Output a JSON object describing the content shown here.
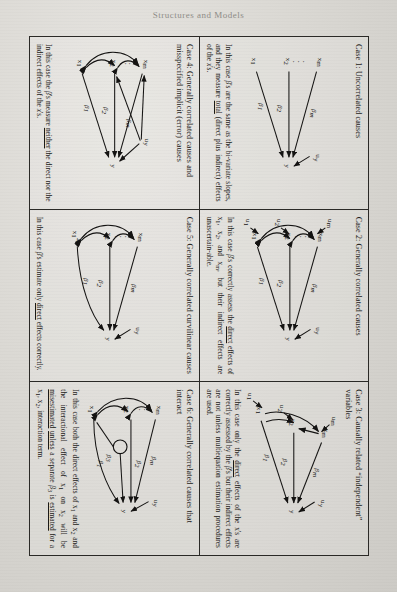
{
  "page": {
    "running_head": "Structures and Models",
    "background_color": "#d8d6d1",
    "ink_color": "#141312"
  },
  "figure": {
    "cases": [
      {
        "id": "case-1",
        "title": "Case 1: Uncorrelated causes",
        "note_html": "In this case <i>β</i>'s are the same as the bi-variate slopes, and they measure <u>total</u> (direct plus indirect) effects of the <i>x</i>'s.",
        "note_text": "In this case β's are the same as the bivariate slopes, and they measure total (direct plus indirect) effects of the x's.",
        "diagram": {
          "type": "path-diagram",
          "nodes": [
            "x₁",
            "x₂",
            "xₘ",
            "y",
            "u_y"
          ],
          "edge_labels": [
            "β₁",
            "β₂",
            "βₘ"
          ],
          "dots": "⋮",
          "features": [
            "no correlation arcs",
            "error term u_y into y"
          ]
        }
      },
      {
        "id": "case-2",
        "title": "Case 2: Generally correlated causes",
        "note_html": "In this case <i>β</i>'s correctly assess the <u>direct</u> effects of x<sub>1</sub>, x<sub>2</sub>, and x<sub>m</sub>, but their indirect effects are unascertain-able.",
        "note_text": "In this case β's correctly assess the direct effects of x₁, x₂, and xₘ, but their indirect effects are unascertainable.",
        "diagram": {
          "type": "path-diagram",
          "nodes": [
            "x₁",
            "x₂",
            "xₘ",
            "y",
            "u₁",
            "u₂",
            "uₘ",
            "u_y"
          ],
          "edge_labels": [
            "β₁",
            "β₂",
            "βₘ"
          ],
          "dots": "⋮",
          "features": [
            "curved double-headed correlation arcs among x's",
            "error terms u on each x"
          ]
        }
      },
      {
        "id": "case-3",
        "title": "Case 3: Causally related “independent” variables",
        "note_html": "In this case only the <u>direct</u> effects of the x's are correctly assessed by the <i>β</i>'s but their indirect effects are not unless multiequation estimation procedures are used.",
        "note_text": "In this case only the direct effects of the x's are correctly assessed by the β's but their indirect effects are not unless multiequation estimation procedures are used.",
        "diagram": {
          "type": "path-diagram",
          "nodes": [
            "x₁",
            "x₂",
            "xₘ",
            "y",
            "u₁",
            "u₂",
            "uₘ",
            "u_y"
          ],
          "edge_labels": [
            "β₁",
            "β₂",
            "βₘ"
          ],
          "features": [
            "single-headed causal arrows between the x's",
            "error terms u on each x"
          ]
        }
      },
      {
        "id": "case-4",
        "title": "Case 4: Generally correlated causes and misspecified implicit (error) causes",
        "note_html": "In this case the <i>β</i>'s measure <u>neither</u> the direct nor the indirect effects of the <i>x</i>'s.",
        "note_text": "In this case the β's measure neither the direct nor the indirect effects of the x's.",
        "diagram": {
          "type": "path-diagram",
          "nodes": [
            "x₁",
            "x₂",
            "xₘ",
            "y",
            "u_y"
          ],
          "edge_labels": [
            "β₁",
            "β₂",
            "βₘ"
          ],
          "dots": "⋮",
          "features": [
            "correlation arcs among x's",
            "u_y has arrows back into x₂ and xₘ (misspecified error causes)"
          ]
        }
      },
      {
        "id": "case-5",
        "title": "Case 5: Generally correlated curvilinear causes",
        "note_html": "In this case <i>β</i>'s estimate only <u>direct</u> effects correctly.",
        "note_text": "In this case β's estimate only direct effects correctly.",
        "diagram": {
          "type": "path-diagram",
          "nodes": [
            "x₁²",
            "x₂",
            "xₘ",
            "y",
            "u_y"
          ],
          "edge_labels": [
            "β₁",
            "β₂",
            "βₘ"
          ],
          "dots": "⋮",
          "features": [
            "squared (curvilinear) term x₁²",
            "correlation arcs among x's"
          ]
        }
      },
      {
        "id": "case-6",
        "title": "Case 6: Generally correlated causes that interact",
        "note_html": "In this case both the direct effects of x<sub>1</sub> and x<sub>2</sub> and the interactional effect of x<sub>1</sub> on x<sub>2</sub> will be <u>misestimated</u> <u>unless</u> a separate <i>β</i><sub>3</sub> is <u>estimated</u> for a x<sub>1</sub>, x<sub>2</sub>, interaction term.",
        "note_text": "In this case both the direct effects of x₁ and x₂ and the interactional effect of x₁ on x₂ will be misestimated unless a separate β₃ is estimated for a x₁x₂ interaction term.",
        "diagram": {
          "type": "path-diagram",
          "nodes": [
            "x₁",
            "x₂",
            "xₘ",
            "y",
            "u_y"
          ],
          "edge_labels": [
            "β₁",
            "β₂",
            "β₃",
            "βₘ"
          ],
          "dots": "⋮",
          "features": [
            "interaction circle node on the x₁–x₂ path feeding y via β₃",
            "correlation arcs among x's"
          ]
        }
      }
    ]
  }
}
